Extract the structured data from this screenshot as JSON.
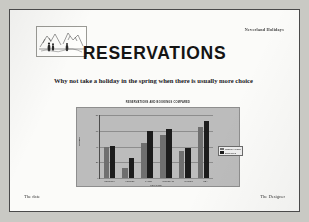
{
  "slide": {
    "brand": "Neverland Holidays",
    "title": "RESERVATIONS",
    "body": "Why not take a holiday in the spring when there is usually more choice",
    "logo_alt": "landscape-sketch-logo",
    "footer_left": "The date",
    "footer_right": "The Designer"
  },
  "chart_data": {
    "type": "bar",
    "title": "RESERVATIONS AND BOOKINGS COMPARED",
    "xlabel": "LOCATION",
    "ylabel": "NUMBER",
    "categories": [
      "COUNTRY",
      "FOREST",
      "LAKES",
      "MOUNTAIN",
      "RIVERS",
      "SEA"
    ],
    "series": [
      {
        "name": "RESERVATIONS",
        "color": "#6f6f6f",
        "values": [
          40,
          13,
          45,
          55,
          34,
          65
        ]
      },
      {
        "name": "BOOKINGS",
        "color": "#1c1c1c",
        "values": [
          41,
          25,
          60,
          62,
          38,
          72
        ]
      }
    ],
    "ylim": [
      0,
      80
    ],
    "yticks": [
      "80",
      "60",
      "40",
      "20",
      "0"
    ],
    "grid": true,
    "legend_position": "right"
  }
}
